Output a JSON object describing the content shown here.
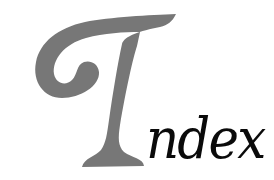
{
  "heading": {
    "word": "Index",
    "initial_letter": "I",
    "rest_text": "ndex",
    "colors": {
      "initial": "#777777",
      "rest": "#0a0a0a",
      "background": "#ffffff"
    }
  }
}
